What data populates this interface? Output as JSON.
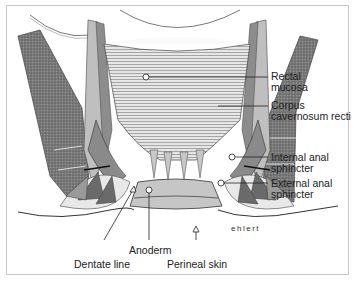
{
  "figure": {
    "signature": "ehlert",
    "colors": {
      "line": "#333333",
      "muscle_dark": "#6e6e6e",
      "muscle_mid": "#9a9a9a",
      "mucosa": "#d0d0d0",
      "anoderm": "#c4c4c4",
      "frame": "#c8c8c8"
    }
  },
  "labels": {
    "rectal_mucosa": {
      "line1": "Rectal",
      "line2": "mucosa"
    },
    "corpus_cavernosum": {
      "line1": "Corpus",
      "line2": "cavernosum recti"
    },
    "internal_sphincter": {
      "line1": "Internal anal",
      "line2": "sphincter"
    },
    "external_sphincter": {
      "line1": "External anal",
      "line2": "sphincter"
    },
    "dentate_line": "Dentate line",
    "anoderm": "Anoderm",
    "perineal_skin": "Perineal skin"
  }
}
